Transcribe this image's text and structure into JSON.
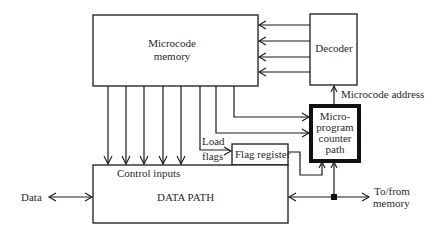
{
  "diagram": {
    "blocks": {
      "microcode_memory": {
        "line1": "Microcode",
        "line2": "memory"
      },
      "decoder": {
        "label": "Decoder"
      },
      "micro_pc": {
        "line1": "Micro-",
        "line2": "program",
        "line3": "counter",
        "line4": "path"
      },
      "flag_register": {
        "label": "Flag register"
      },
      "data_path": {
        "label": "DATA PATH",
        "control_label": "Control inputs"
      }
    },
    "labels": {
      "load_flags_1": "Load",
      "load_flags_2": "flags",
      "microcode_address": "Microcode address",
      "data": "Data",
      "to_from_1": "To/from",
      "to_from_2": "memory"
    },
    "connections": [
      {
        "from": "Decoder",
        "to": "Microcode memory",
        "count": 4
      },
      {
        "from": "Microcode memory",
        "to": "DATA PATH",
        "label": "Control inputs",
        "count": 5
      },
      {
        "from": "Microcode memory",
        "to": "Flag register",
        "label": "Load flags"
      },
      {
        "from": "Microcode memory",
        "to": "Micro-program counter path",
        "count": 2
      },
      {
        "from": "Micro-program counter path",
        "to": "Decoder",
        "label": "Microcode address"
      },
      {
        "from": "Flag register",
        "to": "Micro-program counter path"
      },
      {
        "from": "DATA PATH",
        "to": "To/from memory",
        "bidirectional": true
      },
      {
        "from": "Data",
        "to": "DATA PATH",
        "bidirectional": true
      }
    ],
    "colors": {
      "stroke": "#1a1a1a",
      "background": "#ffffff",
      "text": "#2a2a2a"
    }
  }
}
